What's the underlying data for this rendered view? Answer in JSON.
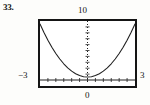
{
  "figure": {
    "exercise_number": "33.",
    "labels": {
      "y_max": "10",
      "y_min": "0",
      "x_min": "−3",
      "x_max": "3"
    },
    "colors": {
      "frame": "#151515",
      "curve": "#202020",
      "axis": "#202020",
      "background": "#ffffff",
      "text": "#141414"
    }
  },
  "chart_data": {
    "type": "line",
    "title": "",
    "subtitle": "",
    "xlabel": "",
    "ylabel": "",
    "xlim": [
      -3,
      3
    ],
    "ylim": [
      0,
      10
    ],
    "grid": false,
    "legend": null,
    "x_axis_ticks": [
      -2.5,
      -2,
      -1.5,
      -1,
      -0.5,
      0,
      0.5,
      1,
      1.5,
      2,
      2.5
    ],
    "y_axis_ticks": [
      1,
      2,
      3,
      4,
      5,
      6,
      7,
      8,
      9
    ],
    "axis_style": "dotted-vertical-solid-horizontal",
    "annotations": [],
    "series": [
      {
        "name": "parabola",
        "x": [
          -3,
          -2.75,
          -2.5,
          -2.25,
          -2,
          -1.75,
          -1.5,
          -1.25,
          -1,
          -0.75,
          -0.5,
          -0.25,
          0,
          0.25,
          0.5,
          0.75,
          1,
          1.25,
          1.5,
          1.75,
          2,
          2.25,
          2.5,
          2.75,
          3
        ],
        "y": [
          9.5,
          8.06,
          6.75,
          5.56,
          4.5,
          3.56,
          2.75,
          2.06,
          1.5,
          1.06,
          0.75,
          0.56,
          0.5,
          0.56,
          0.75,
          1.06,
          1.5,
          2.06,
          2.75,
          3.56,
          4.5,
          5.56,
          6.75,
          8.06,
          9.5
        ]
      }
    ]
  }
}
